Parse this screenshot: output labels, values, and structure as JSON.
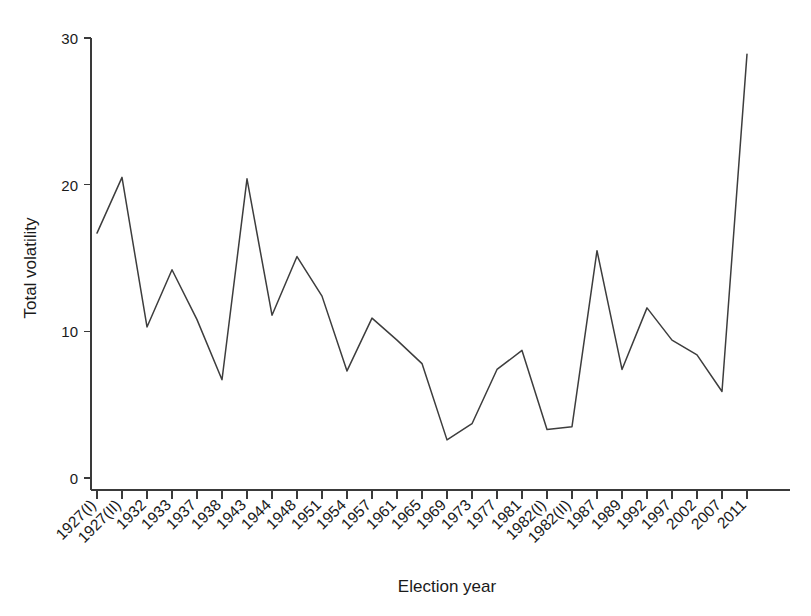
{
  "chart_data": {
    "type": "line",
    "title": "",
    "xlabel": "Election year",
    "ylabel": "Total volatility",
    "categories": [
      "1927(I)",
      "1927(II)",
      "1932",
      "1933",
      "1937",
      "1938",
      "1943",
      "1944",
      "1948",
      "1951",
      "1954",
      "1957",
      "1961",
      "1965",
      "1969",
      "1973",
      "1977",
      "1981",
      "1982(I)",
      "1982(II)",
      "1987",
      "1989",
      "1992",
      "1997",
      "2002",
      "2007",
      "2011"
    ],
    "values": [
      16.7,
      20.5,
      10.3,
      14.2,
      10.8,
      6.7,
      20.4,
      11.1,
      15.1,
      12.4,
      7.3,
      10.9,
      9.4,
      7.8,
      2.6,
      3.7,
      7.4,
      8.7,
      3.3,
      3.5,
      15.5,
      7.4,
      11.6,
      9.4,
      8.4,
      5.9,
      28.9
    ],
    "series": [
      {
        "name": "Total volatility",
        "values": [
          16.7,
          20.5,
          10.3,
          14.2,
          10.8,
          6.7,
          20.4,
          11.1,
          15.1,
          12.4,
          7.3,
          10.9,
          9.4,
          7.8,
          2.6,
          3.7,
          7.4,
          8.7,
          3.3,
          3.5,
          15.5,
          7.4,
          11.6,
          9.4,
          8.4,
          5.9,
          28.9
        ],
        "color": "#3d3d3d"
      }
    ],
    "ylim": [
      0,
      30
    ],
    "yticks": [
      0,
      10,
      20,
      30
    ],
    "ytick_labels": [
      "0",
      "10",
      "20",
      "30"
    ],
    "grid": false,
    "legend": false,
    "legend_position": "none",
    "line_color": "#3d3d3d",
    "axis_color": "#3a3a3a",
    "background": "#ffffff",
    "xtick_rotation": -45
  },
  "axes": {
    "y_title": "Total volatility",
    "x_title": "Election year"
  }
}
